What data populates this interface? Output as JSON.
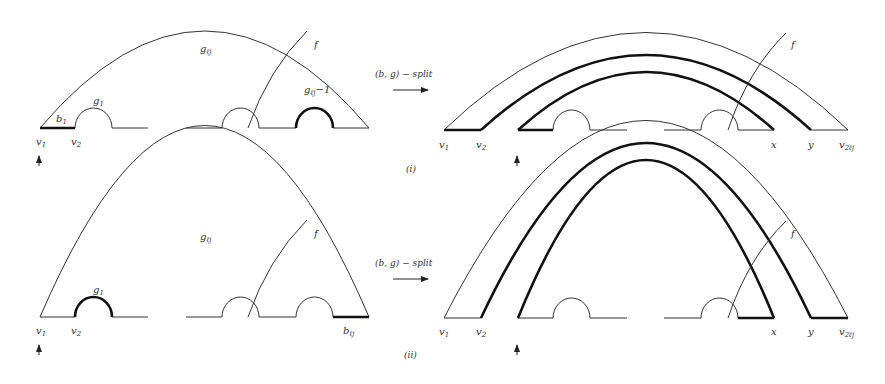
{
  "figure": {
    "panels": [
      {
        "id": "i",
        "caption": "(i)",
        "arrow_label": "(b, g) − split",
        "before": {
          "labels": {
            "outer_arc": "gℓj",
            "cut": "f",
            "first_bump": "g1",
            "last_bump": "gℓj−1",
            "first_segment": "b1",
            "v1": "v1",
            "v2": "v2"
          },
          "thick_parts": [
            "b1",
            "gℓj−1"
          ]
        },
        "after": {
          "labels": {
            "cut": "f",
            "v1": "v1",
            "v2": "v2",
            "x": "x",
            "y": "y",
            "v_end": "v2ℓj"
          }
        }
      },
      {
        "id": "ii",
        "caption": "(ii)",
        "arrow_label": "(b, g) − split",
        "before": {
          "labels": {
            "outer_arc": "gℓj",
            "cut": "f",
            "first_bump": "g1",
            "last_segment": "bℓj",
            "v1": "v1",
            "v2": "v2"
          },
          "thick_parts": [
            "g1",
            "bℓj"
          ]
        },
        "after": {
          "labels": {
            "cut": "f",
            "v1": "v1",
            "v2": "v2",
            "x": "x",
            "y": "y",
            "v_end": "v2ℓj"
          }
        }
      }
    ]
  }
}
